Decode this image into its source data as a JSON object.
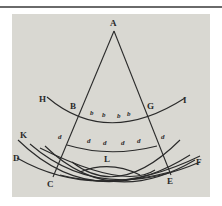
{
  "diagram": {
    "type": "geometric figure (historical engraving, wave/reflection construction)",
    "points": [
      {
        "id": "A",
        "label": "A",
        "x": 114,
        "y": 24
      },
      {
        "id": "B",
        "label": "B",
        "x": 73,
        "y": 107
      },
      {
        "id": "G",
        "label": "G",
        "x": 151,
        "y": 107
      },
      {
        "id": "H",
        "label": "H",
        "x": 43,
        "y": 100
      },
      {
        "id": "I",
        "label": "I",
        "x": 186,
        "y": 101
      },
      {
        "id": "K",
        "label": "K",
        "x": 24,
        "y": 138
      },
      {
        "id": "D",
        "label": "D",
        "x": 16,
        "y": 161
      },
      {
        "id": "C",
        "label": "C",
        "x": 51,
        "y": 186
      },
      {
        "id": "E",
        "label": "E",
        "x": 170,
        "y": 183
      },
      {
        "id": "F",
        "label": "F",
        "x": 197,
        "y": 164
      },
      {
        "id": "L",
        "label": "L",
        "x": 107,
        "y": 162
      }
    ],
    "small_labels_b": [
      "b",
      "b",
      "b",
      "b"
    ],
    "small_labels_d": [
      "d",
      "d",
      "d",
      "d",
      "d",
      "d"
    ],
    "colors": {
      "background": "#d9d8d2",
      "ink": "#2a2a2a",
      "page": "#ffffff"
    }
  }
}
